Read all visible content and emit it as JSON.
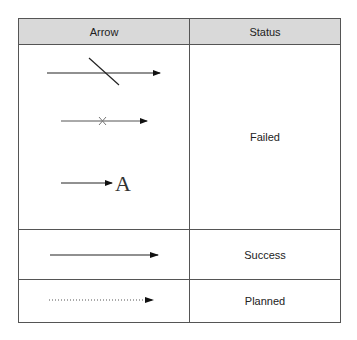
{
  "table": {
    "headers": [
      "Arrow",
      "Status"
    ],
    "rows": [
      {
        "arrow_variants": [
          "arrow-with-slash",
          "arrow-with-cross",
          "arrow-to-label"
        ],
        "arrow_label": "A",
        "status": "Failed"
      },
      {
        "arrow_variants": [
          "solid-arrow"
        ],
        "status": "Success"
      },
      {
        "arrow_variants": [
          "dotted-arrow"
        ],
        "status": "Planned"
      }
    ]
  },
  "colors": {
    "header_bg": "#d9d9d9",
    "border": "#555555",
    "line": "#222222"
  }
}
